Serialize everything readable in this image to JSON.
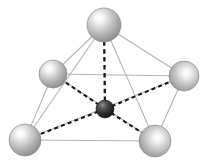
{
  "figure": {
    "background_color": "#ffffff",
    "width": 208,
    "height": 164
  },
  "chart_data": {
    "type": "scatter",
    "subtitle": "",
    "xlabel": "",
    "ylabel": "",
    "grid": false,
    "legend_position": "none",
    "projection": "3d-perspective",
    "xlim": [
      0,
      208
    ],
    "ylim": [
      0,
      164
    ],
    "series": [
      {
        "name": "ligand-spheres",
        "marker": "sphere",
        "color": "#b0b0b0",
        "highlight_color": "#ffffff",
        "shadow_color": "#6e6e6e",
        "values": [
          {
            "id": "apex",
            "label": "apex",
            "cx": 104,
            "cy": 25,
            "r": 17
          },
          {
            "id": "rear-left",
            "label": "rear-left",
            "cx": 53,
            "cy": 74,
            "r": 14
          },
          {
            "id": "rear-right",
            "label": "rear-right",
            "cx": 184,
            "cy": 76,
            "r": 15
          },
          {
            "id": "front-left",
            "label": "front-left",
            "cx": 25,
            "cy": 140,
            "r": 16
          },
          {
            "id": "front-right",
            "label": "front-right",
            "cx": 155,
            "cy": 141,
            "r": 16
          }
        ]
      },
      {
        "name": "central-atom",
        "marker": "sphere",
        "color": "#2e2e2e",
        "highlight_color": "#8a8a8a",
        "shadow_color": "#000000",
        "values": [
          {
            "id": "center",
            "label": "center",
            "cx": 105,
            "cy": 109,
            "r": 9
          }
        ]
      }
    ],
    "bonds": [
      {
        "from": "center",
        "to": "apex",
        "style": "dashed",
        "color": "#1a1a1a"
      },
      {
        "from": "center",
        "to": "rear-left",
        "style": "dashed",
        "color": "#1a1a1a"
      },
      {
        "from": "center",
        "to": "rear-right",
        "style": "dashed",
        "color": "#1a1a1a"
      },
      {
        "from": "center",
        "to": "front-left",
        "style": "dashed",
        "color": "#1a1a1a"
      },
      {
        "from": "center",
        "to": "front-right",
        "style": "dashed",
        "color": "#1a1a1a"
      }
    ],
    "cage_edges": [
      {
        "from": "apex",
        "to": "rear-left",
        "style": "solid",
        "color": "#b4b4b4"
      },
      {
        "from": "apex",
        "to": "rear-right",
        "style": "solid",
        "color": "#b4b4b4"
      },
      {
        "from": "apex",
        "to": "front-left",
        "style": "solid",
        "color": "#b4b4b4"
      },
      {
        "from": "apex",
        "to": "front-right",
        "style": "solid",
        "color": "#b4b4b4"
      },
      {
        "from": "rear-left",
        "to": "rear-right",
        "style": "solid",
        "color": "#b4b4b4"
      },
      {
        "from": "rear-left",
        "to": "front-left",
        "style": "solid",
        "color": "#b4b4b4"
      },
      {
        "from": "rear-right",
        "to": "front-right",
        "style": "solid",
        "color": "#b4b4b4"
      },
      {
        "from": "front-left",
        "to": "front-right",
        "style": "solid",
        "color": "#b4b4b4"
      },
      {
        "from": "rear-left",
        "to": "front-right",
        "style": "solid",
        "color": "#b4b4b4"
      },
      {
        "from": "rear-right",
        "to": "front-left",
        "style": "solid",
        "color": "#b4b4b4"
      }
    ],
    "annotations": []
  }
}
